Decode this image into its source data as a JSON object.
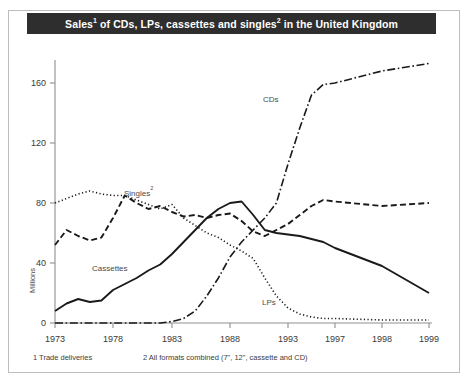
{
  "figure": {
    "title_parts": {
      "a": "Sales",
      "sup1": "1",
      "b": " of CDs, LPs, cassettes and singles",
      "sup2": "2",
      "c": " in the United Kingdom"
    },
    "title_plain": "Sales1 of CDs, LPs, cassettes and singles2 in the United Kingdom",
    "title_bg": "#2e2e2e",
    "title_color": "#ffffff",
    "border_color": "#bdbdbd",
    "axis_color": "#8f8f8f",
    "line_color": "#1a1a1a"
  },
  "footnotes": [
    {
      "marker": "1",
      "text": "1 Trade deliveries"
    },
    {
      "marker": "2",
      "text": "2 All formats combined (7\", 12\", cassette and CD)"
    }
  ],
  "series_labels": [
    {
      "name": "singles-label",
      "text": "Singles",
      "sup": "2",
      "x": 124,
      "y": 196
    },
    {
      "name": "cds-label",
      "text": "CDs",
      "sup": "",
      "x": 263,
      "y": 102
    },
    {
      "name": "cassettes-label",
      "text": "Cassettes",
      "sup": "",
      "x": 92,
      "y": 271
    },
    {
      "name": "lps-label",
      "text": "LPs",
      "sup": "",
      "x": 262,
      "y": 305
    }
  ],
  "chart_data": {
    "type": "line",
    "title": "Sales1 of CDs, LPs, cassettes and singles2 in the United Kingdom",
    "xlabel": "",
    "ylabel": "Millions",
    "ylim": [
      0,
      180
    ],
    "yticks": [
      0,
      40,
      80,
      120,
      160
    ],
    "ytick_labels": [
      "0",
      "40",
      "80",
      "120",
      "160"
    ],
    "xticks": [
      1973,
      1978,
      1983,
      1988,
      1993,
      1997,
      1998,
      1999
    ],
    "xtick_labels": [
      "1973",
      "1978",
      "1983",
      "1988",
      "1993",
      "1997",
      "1998",
      "1999"
    ],
    "xlim": [
      1973,
      1999
    ],
    "grid": false,
    "legend": "inline-labels",
    "x": [
      1973,
      1974,
      1975,
      1976,
      1977,
      1978,
      1979,
      1980,
      1981,
      1982,
      1983,
      1984,
      1985,
      1986,
      1987,
      1988,
      1989,
      1990,
      1991,
      1992,
      1993,
      1994,
      1995,
      1996,
      1997,
      1998,
      1999
    ],
    "series": [
      {
        "name": "LPs",
        "style": "dotted",
        "values": [
          80,
          83,
          86,
          88,
          86,
          85,
          85,
          82,
          79,
          76,
          79,
          70,
          65,
          60,
          57,
          52,
          48,
          43,
          30,
          18,
          10,
          6,
          4,
          3,
          3,
          2,
          2
        ]
      },
      {
        "name": "Singles",
        "style": "dashed",
        "values": [
          52,
          62,
          58,
          55,
          57,
          70,
          85,
          80,
          76,
          78,
          74,
          71,
          72,
          70,
          72,
          73,
          68,
          61,
          58,
          62,
          66,
          72,
          78,
          82,
          81,
          78,
          80
        ]
      },
      {
        "name": "Cassettes",
        "style": "solid",
        "values": [
          8,
          13,
          16,
          14,
          15,
          22,
          26,
          30,
          35,
          39,
          46,
          54,
          62,
          70,
          76,
          80,
          81,
          72,
          62,
          60,
          59,
          58,
          56,
          54,
          50,
          38,
          20
        ]
      },
      {
        "name": "CDs",
        "style": "dashdot",
        "values": [
          0,
          0,
          0,
          0,
          0,
          0,
          0,
          0,
          0,
          0,
          1,
          3,
          8,
          18,
          30,
          44,
          54,
          62,
          70,
          80,
          106,
          130,
          152,
          159,
          160,
          168,
          173
        ]
      }
    ]
  }
}
